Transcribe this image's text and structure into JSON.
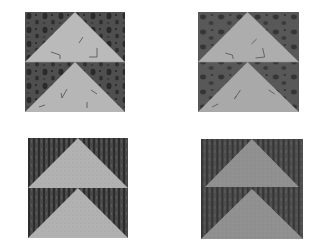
{
  "image": {
    "description": "Four quilt blocks arranged in a 2x2 grid, each showing two stacked 'flying geese' triangles pointing up",
    "background": "#ffffff",
    "blocks": [
      {
        "id": "top-left",
        "pattern": "mottled dark print background with light triangles bearing small angular marks",
        "background_color": "#4a4a4a",
        "triangle_color": "#b8b8b8"
      },
      {
        "id": "top-right",
        "pattern": "mottled dark print background with light triangles bearing small angular marks",
        "background_color": "#555555",
        "triangle_color": "#ababab"
      },
      {
        "id": "bottom-left",
        "pattern": "vertical striped dark background with speckled light triangles",
        "background_color": "#3e3e3e",
        "triangle_color": "#b0b0b0"
      },
      {
        "id": "bottom-right",
        "pattern": "vertical striped dark background with medium grey triangles",
        "background_color": "#4c4c4c",
        "triangle_color": "#8e8e8e"
      }
    ]
  }
}
